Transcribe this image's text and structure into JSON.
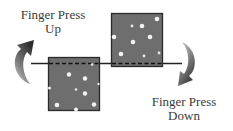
{
  "diagram": {
    "labels": {
      "up": {
        "line1": "Finger Press",
        "line2": "Up"
      },
      "down": {
        "line1": "Finger Press",
        "line2": "Down"
      }
    },
    "colors": {
      "box_fill": "#6e6e6e",
      "box_border": "#2a2a2a",
      "line": "#222222",
      "dots": "#f2f2f2",
      "arrow_dark": "#2e2e2e",
      "arrow_light": "#cfcfcf"
    },
    "elements": {
      "left_box": {
        "x": 48,
        "y": 57,
        "width": 52,
        "height": 54,
        "position": "lowered"
      },
      "right_box": {
        "x": 111,
        "y": 13,
        "width": 52,
        "height": 54,
        "position": "raised"
      },
      "baseline_y": 63,
      "left_arrow": "curved-arrow-up",
      "right_arrow": "curved-arrow-down"
    }
  }
}
